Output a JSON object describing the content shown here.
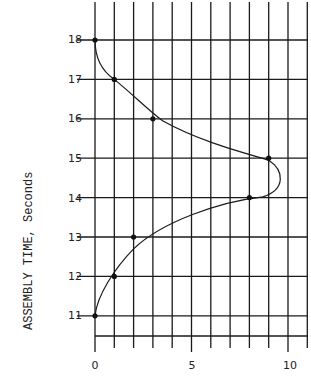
{
  "chart_data": {
    "type": "line",
    "title": "",
    "xlabel": "",
    "ylabel": "ASSEMBLY TIME, Seconds",
    "x_ticks": [
      "0",
      "5",
      "10"
    ],
    "y_ticks": [
      "18",
      "17",
      "16",
      "15",
      "14",
      "13",
      "12",
      "11"
    ],
    "xlim": [
      0,
      11
    ],
    "ylim": [
      10.5,
      18.5
    ],
    "grid": true,
    "points": [
      {
        "x": 0,
        "y": 18
      },
      {
        "x": 1,
        "y": 17
      },
      {
        "x": 3,
        "y": 16
      },
      {
        "x": 9,
        "y": 15
      },
      {
        "x": 8,
        "y": 14
      },
      {
        "x": 2,
        "y": 13
      },
      {
        "x": 1,
        "y": 12
      },
      {
        "x": 0,
        "y": 11
      }
    ],
    "curve": "smooth bell-shaped fit, peaking near x≈9.7 between y=14 and y=15",
    "legend": []
  },
  "labels": {
    "ylabel": "ASSEMBLY TIME, Seconds",
    "x0": "0",
    "x5": "5",
    "x10": "10",
    "y18": "18",
    "y17": "17",
    "y16": "16",
    "y15": "15",
    "y14": "14",
    "y13": "13",
    "y12": "12",
    "y11": "11"
  }
}
